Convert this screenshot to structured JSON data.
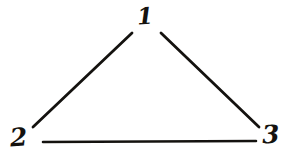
{
  "diagram": {
    "style": "hand-drawn pen sketch",
    "background_color": "#ffffff",
    "ink_color": "#14120f",
    "stroke_width": 2.6,
    "canvas": {
      "width": 289,
      "height": 159
    },
    "vertices": [
      {
        "id": "1",
        "label": "1",
        "name": "vertex-1",
        "position": {
          "x": 145,
          "y": 17
        },
        "label_position": {
          "x": 137,
          "y": 4
        }
      },
      {
        "id": "2",
        "label": "2",
        "name": "vertex-2",
        "position": {
          "x": 22,
          "y": 139
        },
        "label_position": {
          "x": 10,
          "y": 125
        }
      },
      {
        "id": "3",
        "label": "3",
        "name": "vertex-3",
        "position": {
          "x": 272,
          "y": 137
        },
        "label_position": {
          "x": 262,
          "y": 122
        }
      }
    ],
    "edges": [
      {
        "id": "edge-1-2",
        "name": "edge-1-2",
        "from": "1",
        "to": "2",
        "path": "M 132 33 L 33 127",
        "description": "left edge of triangle"
      },
      {
        "id": "edge-1-3",
        "name": "edge-1-3",
        "from": "1",
        "to": "3",
        "path": "M 161 33 L 259 127",
        "description": "right edge of triangle"
      },
      {
        "id": "edge-2-3",
        "name": "edge-2-3",
        "from": "2",
        "to": "3",
        "path": "M 43 142 L 256 141",
        "description": "bottom edge of triangle"
      }
    ]
  }
}
